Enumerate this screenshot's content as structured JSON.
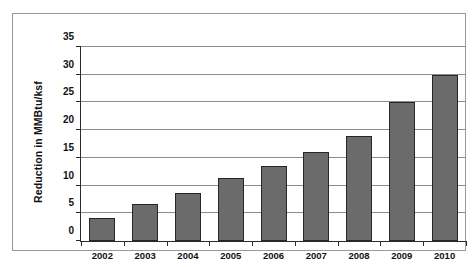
{
  "chart_data": {
    "type": "bar",
    "title": "",
    "xlabel": "",
    "ylabel": "Reduction in MMBtu/ksf",
    "categories": [
      "2002",
      "2003",
      "2004",
      "2005",
      "2006",
      "2007",
      "2008",
      "2009",
      "2010"
    ],
    "values": [
      4.1,
      6.6,
      8.6,
      11.3,
      13.5,
      16.0,
      19.0,
      25.0,
      30.0
    ],
    "series": [
      {
        "name": "Reduction in MMBtu/ksf",
        "values": [
          4.1,
          6.6,
          8.6,
          11.3,
          13.5,
          16.0,
          19.0,
          25.0,
          30.0
        ]
      }
    ],
    "ylim": [
      0,
      35
    ],
    "yticks": [
      0,
      5,
      10,
      15,
      20,
      25,
      30,
      35
    ],
    "ytick_labels": [
      "0",
      "5",
      "10",
      "15",
      "20",
      "25",
      "30",
      "35"
    ],
    "grid": "horizontal",
    "legend": "none",
    "bar_color": "#6b6b6b",
    "bar_border_color": "#262626",
    "gridline_color": "#8d8d8d",
    "axis_color": "#2b2b2b",
    "frame_color": "#9a9a9a",
    "background_color": "#ffffff"
  }
}
